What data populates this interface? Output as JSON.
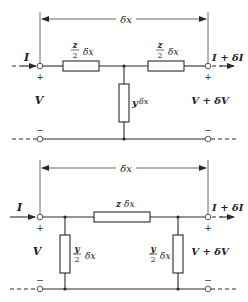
{
  "top_circuit": {
    "name": "T-section",
    "dimension_label": "δx",
    "input_current": "I",
    "output_current": "I + δI",
    "input_voltage": "V",
    "output_voltage": "V + δV",
    "plus_sign": "+",
    "minus_sign": "−",
    "series_left": {
      "num": "z",
      "den": "2",
      "suffix": "δx"
    },
    "series_right": {
      "num": "z",
      "den": "2",
      "suffix": "δx"
    },
    "shunt": {
      "symbol": "y",
      "suffix": "δx"
    }
  },
  "bottom_circuit": {
    "name": "Pi-section",
    "dimension_label": "δx",
    "input_current": "I",
    "output_current": "I + δI",
    "input_voltage": "V",
    "output_voltage": "V + δV",
    "plus_sign": "+",
    "minus_sign": "−",
    "series": {
      "symbol": "z",
      "suffix": "δx"
    },
    "shunt_left": {
      "num": "y",
      "den": "2",
      "suffix": "δx"
    },
    "shunt_right": {
      "num": "y",
      "den": "2",
      "suffix": "δx"
    }
  }
}
